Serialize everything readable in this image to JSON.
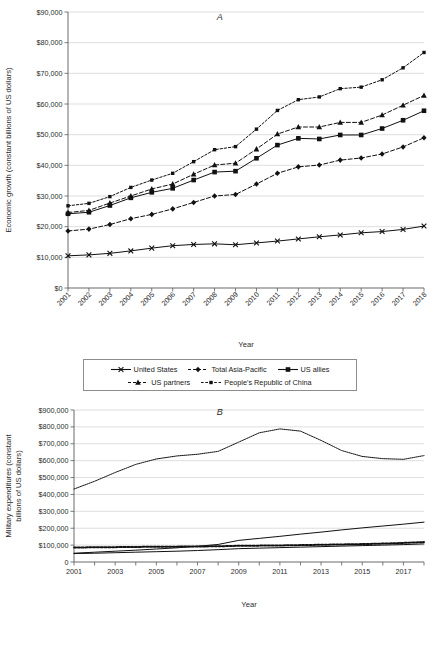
{
  "figures": [
    {
      "id": "A",
      "panel_label": "A",
      "legend_rows": [
        [
          {
            "label": "United States",
            "style": "solid-x"
          },
          {
            "label": "Total Asia-Pacific",
            "style": "dotted-diamond"
          },
          {
            "label": "US allies",
            "style": "solid-square"
          }
        ],
        [
          {
            "label": "US partners",
            "style": "dotted-triangle"
          },
          {
            "label": "People's Republic of China",
            "style": "dashed-square"
          }
        ]
      ]
    },
    {
      "id": "B",
      "panel_label": "B",
      "legend_rows": [
        [
          {
            "label": "Allies",
            "style": "thick-dotted"
          },
          {
            "label": "Partners",
            "style": "solid-black"
          },
          {
            "label": "People's Republic of China",
            "style": "solid-gray"
          },
          {
            "label": "United States",
            "style": "fine-dotted"
          }
        ]
      ]
    }
  ],
  "chart_data": [
    {
      "type": "line",
      "title": "A",
      "xlabel": "Year",
      "ylabel": "Economic growth (constant billions of US dollars)",
      "x": [
        2001,
        2002,
        2003,
        2004,
        2005,
        2006,
        2007,
        2008,
        2009,
        2010,
        2011,
        2012,
        2013,
        2014,
        2015,
        2016,
        2017,
        2018
      ],
      "xtick_labels": [
        "2001",
        "2002",
        "2003",
        "2004",
        "2005",
        "2006",
        "2007",
        "2008",
        "2009",
        "2010",
        "2011",
        "2012",
        "2013",
        "2014",
        "2015",
        "2016",
        "2017",
        "2018"
      ],
      "xtick_rotation": 45,
      "ylim": [
        0,
        90000
      ],
      "ytick_values": [
        0,
        10000,
        20000,
        30000,
        40000,
        50000,
        60000,
        70000,
        80000,
        90000
      ],
      "ytick_labels": [
        "$0",
        "$10,000",
        "$20,000",
        "$30,000",
        "$40,000",
        "$50,000",
        "$60,000",
        "$70,000",
        "$80,000",
        "$90,000"
      ],
      "grid": "horizontal",
      "legend_position": "below",
      "series": [
        {
          "name": "United States",
          "marker": "x",
          "dash": "none",
          "values": [
            10500,
            10800,
            11300,
            12100,
            13000,
            13800,
            14200,
            14400,
            14100,
            14700,
            15300,
            16000,
            16700,
            17300,
            18000,
            18400,
            19100,
            20200
          ]
        },
        {
          "name": "Total Asia-Pacific",
          "marker": "diamond",
          "dash": "dash",
          "values": [
            18600,
            19200,
            20700,
            22600,
            24000,
            25800,
            27900,
            30000,
            30500,
            33900,
            37400,
            39500,
            40100,
            41700,
            42400,
            43700,
            46000,
            49000
          ]
        },
        {
          "name": "US allies",
          "marker": "square",
          "dash": "none",
          "values": [
            24200,
            24700,
            26900,
            29400,
            31200,
            32500,
            35200,
            37800,
            38100,
            42300,
            46600,
            48800,
            48600,
            49900,
            49900,
            52000,
            54700,
            57800
          ]
        },
        {
          "name": "US partners",
          "marker": "triangle",
          "dash": "dash",
          "values": [
            24600,
            25300,
            27700,
            30000,
            32300,
            33900,
            37100,
            40100,
            40700,
            45300,
            50200,
            52500,
            52500,
            54000,
            54000,
            56400,
            59600,
            62800
          ]
        },
        {
          "name": "People's Republic of China",
          "marker": "square-small",
          "dash": "dot",
          "values": [
            26800,
            27600,
            29800,
            32800,
            35200,
            37400,
            41200,
            45100,
            46100,
            51800,
            57900,
            61400,
            62300,
            65000,
            65500,
            67900,
            71800,
            76800
          ]
        }
      ]
    },
    {
      "type": "line",
      "title": "B",
      "xlabel": "Year",
      "ylabel": "Military expenditures (constant billions of US dollars)",
      "x": [
        2001,
        2002,
        2003,
        2004,
        2005,
        2006,
        2007,
        2008,
        2009,
        2010,
        2011,
        2012,
        2013,
        2014,
        2015,
        2016,
        2017,
        2018
      ],
      "xtick_labels": [
        "2001",
        "2003",
        "2005",
        "2007",
        "2009",
        "2011",
        "2013",
        "2015",
        "2017"
      ],
      "xtick_label_values": [
        2001,
        2003,
        2005,
        2007,
        2009,
        2011,
        2013,
        2015,
        2017
      ],
      "xtick_rotation": 0,
      "ylim": [
        0,
        900000
      ],
      "ytick_values": [
        0,
        100000,
        200000,
        300000,
        400000,
        500000,
        600000,
        700000,
        800000,
        900000
      ],
      "ytick_labels": [
        "0",
        "$100,000",
        "$200,000",
        "$300,000",
        "$400,000",
        "$500,000",
        "$600,000",
        "$700,000",
        "$800,000",
        "$900,000"
      ],
      "grid": "horizontal",
      "legend_position": "below",
      "series": [
        {
          "name": "United States",
          "marker": "none",
          "dash": "fine-dot",
          "values": [
            432000,
            478000,
            530000,
            578000,
            610000,
            628000,
            638000,
            655000,
            710000,
            765000,
            788000,
            775000,
            720000,
            660000,
            625000,
            612000,
            608000,
            630000
          ]
        },
        {
          "name": "People's Republic of China",
          "marker": "none",
          "dash": "none",
          "color": "#777777",
          "values": [
            52000,
            58000,
            64000,
            70000,
            77000,
            84000,
            93000,
            104000,
            128000,
            140000,
            152000,
            165000,
            177000,
            190000,
            202000,
            213000,
            224000,
            236000
          ]
        },
        {
          "name": "Allies",
          "marker": "none",
          "dash": "thick-dot",
          "values": [
            86000,
            87000,
            88000,
            89000,
            91000,
            91000,
            92000,
            93000,
            96000,
            97000,
            98000,
            100000,
            102000,
            104000,
            106000,
            109000,
            113000,
            118000
          ]
        },
        {
          "name": "Partners",
          "marker": "none",
          "dash": "none",
          "values": [
            50000,
            52000,
            55000,
            58000,
            61000,
            64000,
            68000,
            73000,
            79000,
            82000,
            85000,
            88000,
            91000,
            94000,
            97000,
            100000,
            103000,
            107000
          ]
        }
      ]
    }
  ]
}
